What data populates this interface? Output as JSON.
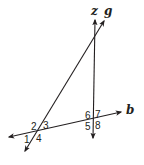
{
  "diagram": {
    "type": "geometry-lines-transversal",
    "colors": {
      "stroke": "#231f20",
      "background": "#ffffff"
    },
    "lines": [
      {
        "id": "z",
        "label": "z"
      },
      {
        "id": "g",
        "label": "g"
      },
      {
        "id": "b",
        "label": "b"
      }
    ],
    "labels": {
      "z": "z",
      "g": "g",
      "b": "b"
    },
    "angles": {
      "a1": "1",
      "a2": "2",
      "a3": "3",
      "a4": "4",
      "a5": "5",
      "a6": "6",
      "a7": "7",
      "a8": "8"
    },
    "intersections": [
      {
        "lines": [
          "g",
          "b"
        ],
        "angles": [
          "1",
          "2",
          "3",
          "4"
        ]
      },
      {
        "lines": [
          "z",
          "b"
        ],
        "angles": [
          "5",
          "6",
          "7",
          "8"
        ]
      }
    ]
  }
}
